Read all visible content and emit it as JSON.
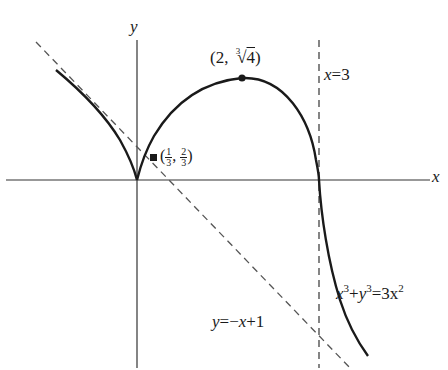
{
  "figure": {
    "type": "curve-sketch",
    "equation_label": {
      "lhs_x": "x",
      "exp1": "3",
      "plus": "+",
      "lhs_y": "y",
      "exp2": "3",
      "eq": "=",
      "rhs": "3x",
      "exp3": "2"
    },
    "axes": {
      "x_label": "x",
      "y_label": "y"
    },
    "asymptote_vertical": {
      "label_var": "x",
      "label_rest": "=3"
    },
    "asymptote_oblique": {
      "label_var": "y",
      "label_eq": "=−",
      "label_var2": "x",
      "label_rest": "+1"
    },
    "points": [
      {
        "name": "max-point",
        "prefix": "(2, ",
        "root_index": "3",
        "root_sign": "√",
        "radicand": "4",
        "suffix": ")"
      },
      {
        "name": "tangent-point",
        "open": "(",
        "num1": "1",
        "den1": "3",
        "sep": ", ",
        "num2": "2",
        "den2": "3",
        "close": ")"
      }
    ],
    "colors": {
      "curve": "#1a1a1a",
      "axes": "#333333",
      "dashed": "#555555"
    }
  }
}
